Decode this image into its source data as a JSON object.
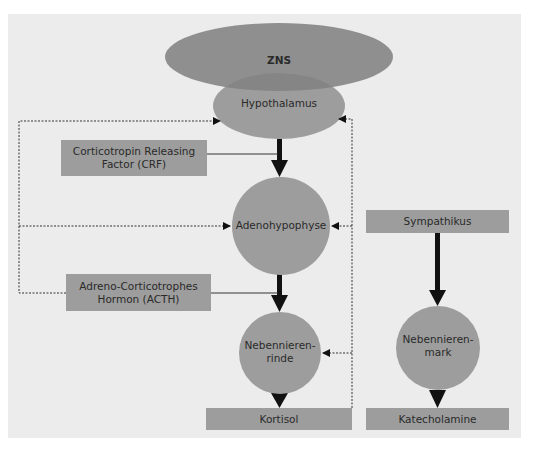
{
  "diagram": {
    "colors": {
      "background": "#ececec",
      "node_fill": "#9d9d9d",
      "zns_fill": "#8f8f8f",
      "overlap_fill": "#858585",
      "arrow": "#111111",
      "text": "#2a2a2a"
    },
    "nodes": {
      "zns": "ZNS",
      "hypothalamus": "Hypothalamus",
      "crf_line1": "Corticotropin Releasing",
      "crf_line2": "Factor (CRF)",
      "adenohypophyse": "Adenohypophyse",
      "acth_line1": "Adreno-Corticotrophes",
      "acth_line2": "Hormon (ACTH)",
      "nnr_line1": "Nebennieren-",
      "nnr_line2": "rinde",
      "kortisol": "Kortisol",
      "sympathikus": "Sympathikus",
      "nnm_line1": "Nebennieren-",
      "nnm_line2": "mark",
      "katecholamine": "Katecholamine"
    },
    "edges": [
      {
        "from": "Hypothalamus",
        "to": "Adenohypophyse",
        "type": "solid",
        "label": "Corticotropin Releasing Factor (CRF)"
      },
      {
        "from": "Adenohypophyse",
        "to": "Nebennierenrinde",
        "type": "solid",
        "label": "Adreno-Corticotrophes Hormon (ACTH)"
      },
      {
        "from": "Nebennierenrinde",
        "to": "Kortisol",
        "type": "solid"
      },
      {
        "from": "Sympathikus",
        "to": "Nebennierenmark",
        "type": "solid"
      },
      {
        "from": "Nebennierenmark",
        "to": "Katecholamine",
        "type": "solid"
      },
      {
        "from": "ACTH",
        "to": "Hypothalamus",
        "type": "dashed-feedback"
      },
      {
        "from": "ACTH",
        "to": "Adenohypophyse",
        "type": "dashed-feedback"
      },
      {
        "from": "Kortisol",
        "to": "Hypothalamus",
        "type": "dashed-feedback"
      },
      {
        "from": "Kortisol",
        "to": "Adenohypophyse",
        "type": "dashed-feedback"
      },
      {
        "from": "Kortisol",
        "to": "Nebennierenrinde",
        "type": "dashed-feedback"
      }
    ]
  }
}
